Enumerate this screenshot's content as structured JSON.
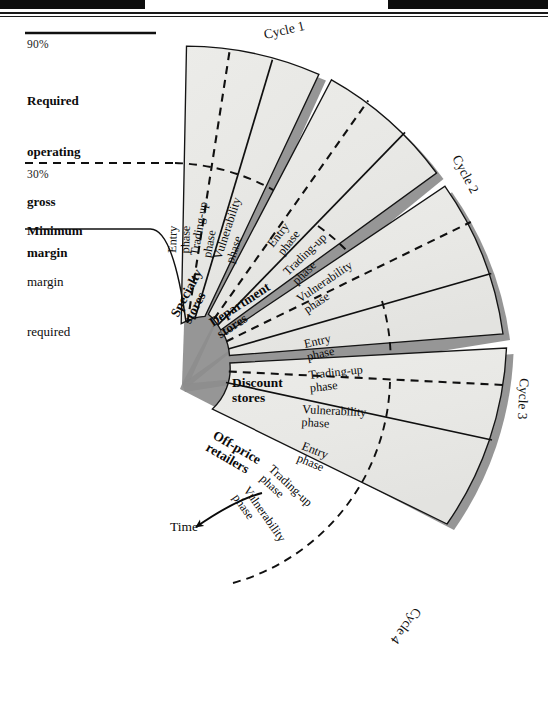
{
  "figure": {
    "type": "wheel-of-retailing-diagram",
    "title_present": false,
    "colors": {
      "segment_fill": "#e9e9e7",
      "segment_fill_alt": "#ededeb",
      "edge_shadow": "#8e8e8e",
      "edge_shadow_dark": "#6f6f6f",
      "stroke": "#111111",
      "page_background": "#ffffff",
      "scan_bar": "#0d0d0d"
    },
    "axis_labels": [
      {
        "id": "upper",
        "percent": "90%",
        "lines": [
          "Required",
          "operating",
          "gross",
          "margin"
        ],
        "line_style": "solid"
      },
      {
        "id": "lower",
        "percent": "30%",
        "lines": [
          "Minimum",
          "margin",
          "required"
        ],
        "line_style": "dashed"
      }
    ],
    "time_arrow_label": "Time",
    "store_types": [
      "Specialty\nstores",
      "Department\nstores",
      "Discount\nstores",
      "Off-price\nretailers"
    ],
    "store_types_flat": [
      "Specialty stores",
      "Department stores",
      "Discount stores",
      "Off-price retailers"
    ],
    "phases": [
      "Entry\nphase",
      "Trading-up\nphase",
      "Vulnerability\nphase"
    ],
    "phases_flat": [
      "Entry phase",
      "Trading-up phase",
      "Vulnerability phase"
    ],
    "cycles": [
      {
        "label": "Cycle 1",
        "store": "Specialty stores",
        "phases": [
          "Entry phase",
          "Trading-up phase",
          "Vulnerability phase"
        ]
      },
      {
        "label": "Cycle 2",
        "store": "Department stores",
        "phases": [
          "Entry phase",
          "Trading-up phase",
          "Vulnerability phase"
        ]
      },
      {
        "label": "Cycle 3",
        "store": "Discount stores",
        "phases": [
          "Entry phase",
          "Trading-up phase",
          "Vulnerability phase"
        ]
      },
      {
        "label": "Cycle 4",
        "store": "Off-price retailers",
        "phases": [
          "Entry phase",
          "Trading-up phase",
          "Vulnerability phase"
        ]
      }
    ],
    "cycle_labels": [
      "Cycle 1",
      "Cycle 2",
      "Cycle 3",
      "Cycle 4"
    ],
    "phase_text": {
      "entry_1": "Entry",
      "entry_2": "phase",
      "trading_1": "Trading-up",
      "trading_2": "phase",
      "vuln_1": "Vulnerability",
      "vuln_2": "phase"
    },
    "store_text": {
      "specialty_1": "Specialty",
      "specialty_2": "stores",
      "department_1": "Department",
      "department_2": "stores",
      "discount_1": "Discount",
      "discount_2": "stores",
      "offprice_1": "Off-price",
      "offprice_2": "retailers"
    }
  }
}
